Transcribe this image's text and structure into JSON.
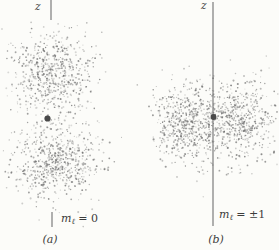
{
  "figure": {
    "background": "#fcfcf9",
    "seed": 1337,
    "dot_color": "#6a6a6a",
    "axis_color": "#8f8f8f",
    "nucleus_color": "#484848",
    "text_color": "#3c3c3c",
    "panels": [
      {
        "id": "a",
        "z_label": "z",
        "m_label": {
          "base": "m",
          "sub": "ℓ",
          "value": " = 0"
        },
        "caption": "(a)",
        "bounds": {
          "x1": 1,
          "x2": 126,
          "y1": 18,
          "y2": 231
        },
        "axis_segments": [
          {
            "x": 51,
            "y1": 0,
            "y2": 20
          },
          {
            "x": 52,
            "y1": 212,
            "y2": 227
          }
        ],
        "cloud": {
          "lobes": [
            {
              "cx": 51,
              "cy": 75,
              "sx": 21,
              "sy": 20,
              "count": 620
            },
            {
              "cx": 56,
              "cy": 162,
              "sx": 22,
              "sy": 20,
              "count": 640
            }
          ]
        },
        "nucleus": {
          "x": 47.5,
          "y": 118.5,
          "r": 3.1
        }
      },
      {
        "id": "b",
        "z_label": "z",
        "m_label": {
          "base": "m",
          "sub": "ℓ",
          "value": " = ±1"
        },
        "caption": "(b)",
        "bounds": {
          "x1": 134,
          "x2": 278,
          "y1": 55,
          "y2": 203
        },
        "axis_segments": [
          {
            "x": 213,
            "y1": 2,
            "y2": 226
          }
        ],
        "cloud": {
          "lobes": [
            {
              "cx": 188,
              "cy": 123,
              "sx": 18,
              "sy": 21,
              "count": 560
            },
            {
              "cx": 239,
              "cy": 122,
              "sx": 18,
              "sy": 21,
              "count": 560
            }
          ]
        },
        "nucleus": {
          "x": 213.5,
          "y": 117,
          "r": 2.9
        }
      }
    ]
  }
}
